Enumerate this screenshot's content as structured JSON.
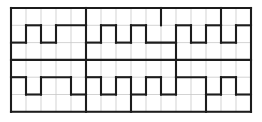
{
  "figure": {
    "background_color": "#ffffff"
  },
  "grid": {
    "columns": 16,
    "rows": 6,
    "origin_x": 11,
    "origin_y": 8,
    "cell_width": 15,
    "cell_height": 17.3,
    "light_line_color": "#c8c8c8",
    "light_line_width": 0.8,
    "bold_line_color": "#1c1c1c",
    "bold_line_width": 2.1,
    "border_line_color": "#8a8a8a",
    "border_line_width": 1.0
  },
  "chart_data": {
    "type": "diagram",
    "xlabel": "",
    "ylabel": "",
    "grid": true,
    "legend": "none",
    "columns": 16,
    "rows": 6,
    "bold_horizontal_segments": [
      {
        "row": 0,
        "col_start": 0,
        "col_end": 16
      },
      {
        "row": 1,
        "col_start": 1,
        "col_end": 2
      },
      {
        "row": 1,
        "col_start": 3,
        "col_end": 5
      },
      {
        "row": 1,
        "col_start": 6,
        "col_end": 7
      },
      {
        "row": 1,
        "col_start": 8,
        "col_end": 9
      },
      {
        "row": 1,
        "col_start": 11,
        "col_end": 12
      },
      {
        "row": 1,
        "col_start": 13,
        "col_end": 14
      },
      {
        "row": 1,
        "col_start": 15,
        "col_end": 16
      },
      {
        "row": 2,
        "col_start": 0,
        "col_end": 1
      },
      {
        "row": 2,
        "col_start": 2,
        "col_end": 3
      },
      {
        "row": 2,
        "col_start": 5,
        "col_end": 6
      },
      {
        "row": 2,
        "col_start": 7,
        "col_end": 8
      },
      {
        "row": 2,
        "col_start": 9,
        "col_end": 11
      },
      {
        "row": 2,
        "col_start": 12,
        "col_end": 13
      },
      {
        "row": 2,
        "col_start": 14,
        "col_end": 15
      },
      {
        "row": 3,
        "col_start": 0,
        "col_end": 16
      },
      {
        "row": 4,
        "col_start": 0,
        "col_end": 1
      },
      {
        "row": 4,
        "col_start": 2,
        "col_end": 4
      },
      {
        "row": 4,
        "col_start": 5,
        "col_end": 6
      },
      {
        "row": 4,
        "col_start": 7,
        "col_end": 8
      },
      {
        "row": 4,
        "col_start": 9,
        "col_end": 10
      },
      {
        "row": 4,
        "col_start": 11,
        "col_end": 13
      },
      {
        "row": 4,
        "col_start": 14,
        "col_end": 15
      },
      {
        "row": 5,
        "col_start": 1,
        "col_end": 2
      },
      {
        "row": 5,
        "col_start": 4,
        "col_end": 5
      },
      {
        "row": 5,
        "col_start": 6,
        "col_end": 7
      },
      {
        "row": 5,
        "col_start": 8,
        "col_end": 9
      },
      {
        "row": 5,
        "col_start": 10,
        "col_end": 11
      },
      {
        "row": 5,
        "col_start": 13,
        "col_end": 14
      },
      {
        "row": 5,
        "col_start": 15,
        "col_end": 16
      },
      {
        "row": 6,
        "col_start": 0,
        "col_end": 16
      }
    ],
    "bold_vertical_segments": [
      {
        "col": 0,
        "row_start": 0,
        "row_end": 6
      },
      {
        "col": 16,
        "row_start": 0,
        "row_end": 6
      },
      {
        "col": 5,
        "row_start": 0,
        "row_end": 1
      },
      {
        "col": 10,
        "row_start": 0,
        "row_end": 1
      },
      {
        "col": 14,
        "row_start": 0,
        "row_end": 1
      },
      {
        "col": 1,
        "row_start": 1,
        "row_end": 2
      },
      {
        "col": 2,
        "row_start": 1,
        "row_end": 2
      },
      {
        "col": 3,
        "row_start": 1,
        "row_end": 2
      },
      {
        "col": 5,
        "row_start": 1,
        "row_end": 2
      },
      {
        "col": 6,
        "row_start": 1,
        "row_end": 2
      },
      {
        "col": 7,
        "row_start": 1,
        "row_end": 2
      },
      {
        "col": 8,
        "row_start": 1,
        "row_end": 2
      },
      {
        "col": 9,
        "row_start": 1,
        "row_end": 2
      },
      {
        "col": 11,
        "row_start": 1,
        "row_end": 2
      },
      {
        "col": 12,
        "row_start": 1,
        "row_end": 2
      },
      {
        "col": 13,
        "row_start": 1,
        "row_end": 2
      },
      {
        "col": 14,
        "row_start": 1,
        "row_end": 2
      },
      {
        "col": 15,
        "row_start": 1,
        "row_end": 2
      },
      {
        "col": 5,
        "row_start": 2,
        "row_end": 3
      },
      {
        "col": 11,
        "row_start": 2,
        "row_end": 3
      },
      {
        "col": 5,
        "row_start": 3,
        "row_end": 4
      },
      {
        "col": 11,
        "row_start": 3,
        "row_end": 4
      },
      {
        "col": 1,
        "row_start": 4,
        "row_end": 5
      },
      {
        "col": 2,
        "row_start": 4,
        "row_end": 5
      },
      {
        "col": 4,
        "row_start": 4,
        "row_end": 5
      },
      {
        "col": 5,
        "row_start": 4,
        "row_end": 5
      },
      {
        "col": 6,
        "row_start": 4,
        "row_end": 5
      },
      {
        "col": 7,
        "row_start": 4,
        "row_end": 5
      },
      {
        "col": 8,
        "row_start": 4,
        "row_end": 5
      },
      {
        "col": 9,
        "row_start": 4,
        "row_end": 5
      },
      {
        "col": 10,
        "row_start": 4,
        "row_end": 5
      },
      {
        "col": 11,
        "row_start": 4,
        "row_end": 5
      },
      {
        "col": 13,
        "row_start": 4,
        "row_end": 5
      },
      {
        "col": 14,
        "row_start": 4,
        "row_end": 5
      },
      {
        "col": 15,
        "row_start": 4,
        "row_end": 5
      },
      {
        "col": 5,
        "row_start": 5,
        "row_end": 6
      },
      {
        "col": 8,
        "row_start": 5,
        "row_end": 6
      },
      {
        "col": 13,
        "row_start": 5,
        "row_end": 6
      }
    ]
  }
}
